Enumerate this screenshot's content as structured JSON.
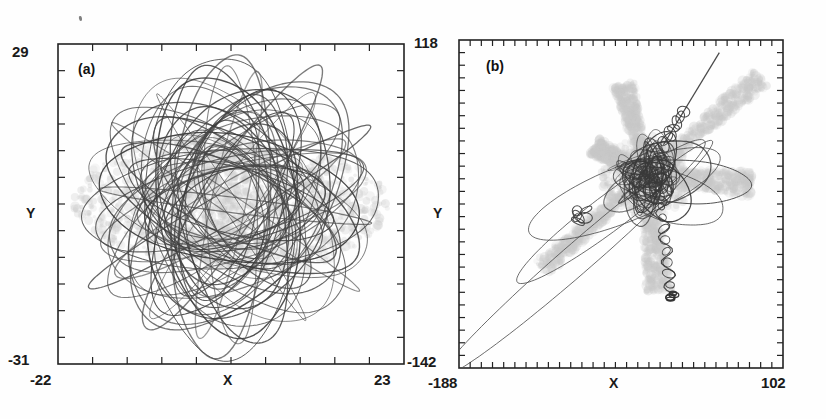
{
  "figure": {
    "title": "",
    "background": "#ffffff",
    "artifact_mark": "scan-speck"
  },
  "colors": {
    "orbit_line": "#4a4a4a",
    "orbit_line_dark": "#3a3a3a",
    "shadow_cloud": "#c9c9c9",
    "axis": "#222222",
    "text": "#1a1a1a"
  },
  "chart_data": [
    {
      "type": "line",
      "panel": "a",
      "panel_label": "(a)",
      "title": "",
      "xlabel": "X",
      "ylabel": "Y",
      "xlim": [
        -22,
        23
      ],
      "ylim": [
        -31,
        29
      ],
      "xticklabels": [
        "-22",
        "23"
      ],
      "yticklabels": [
        "29",
        "-31"
      ],
      "xtick_count": 10,
      "ytick_count": 12,
      "grid": false,
      "legend": "none",
      "description": "Dense rosette of many overlapping precessing elliptical orbits with a faint grey scattered shadow cloud",
      "series": [
        {
          "name": "orbit-rosette",
          "n_orbits": 46,
          "center": [
            0.5,
            -1.0
          ],
          "semi_major_range": [
            6,
            20
          ],
          "eccentricity_range": [
            0.35,
            0.88
          ],
          "angle_step_deg": 23.5
        },
        {
          "name": "shadow-cloud",
          "style": "diffuse-grey",
          "center": [
            0.5,
            -1.0
          ],
          "extent": [
            18,
            17
          ]
        }
      ]
    },
    {
      "type": "line",
      "panel": "b",
      "panel_label": "(b)",
      "title": "",
      "xlabel": "X",
      "ylabel": "Y",
      "xlim": [
        -188,
        102
      ],
      "ylim": [
        -142,
        118
      ],
      "xticklabels": [
        "-188",
        "102"
      ],
      "yticklabels": [
        "118",
        "-142"
      ],
      "xtick_count": 29,
      "ytick_count": 26,
      "grid": false,
      "legend": "none",
      "description": "A few highly eccentric radial orbits along a dominant NE-SW axis, a tangled dense core near upper right, a looping tail descending, and an escaping straight track to the upper right",
      "series": [
        {
          "name": "long-radial-orbit",
          "n_orbits": 3,
          "major_axis_angle_deg": 41,
          "eccentricity_range": [
            0.94,
            0.985
          ],
          "apocenter": [
            -178,
            -132
          ]
        },
        {
          "name": "core-tangle",
          "center": [
            -20,
            10
          ],
          "extent": [
            55,
            50
          ]
        },
        {
          "name": "escape-track",
          "from": [
            -5,
            35
          ],
          "to": [
            45,
            108
          ]
        },
        {
          "name": "descending-tail",
          "from": [
            -8,
            -5
          ],
          "to": [
            2,
            -85
          ]
        },
        {
          "name": "shadow-cloud",
          "style": "diffuse-grey",
          "center": [
            -20,
            5
          ]
        }
      ]
    }
  ],
  "panel_a": {
    "label": "(a)",
    "y_max": "29",
    "y_min": "-31",
    "x_min": "-22",
    "x_max": "23",
    "x_name": "X",
    "y_name": "Y"
  },
  "panel_b": {
    "label": "(b)",
    "y_max": "118",
    "y_min": "-142",
    "x_min": "-188",
    "x_max": "102",
    "x_name": "X",
    "y_name": "Y"
  }
}
